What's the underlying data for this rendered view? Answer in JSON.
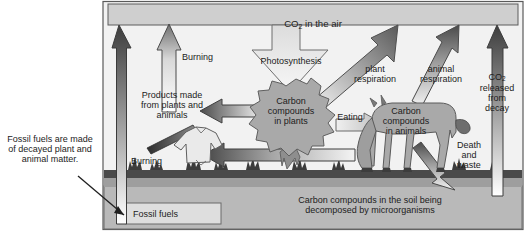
{
  "diagram": {
    "type": "carbon-cycle-flow-diagram",
    "palette": {
      "frame_border": "#5a5a5a",
      "sky_panel": "#cfcfcf",
      "ground_soil": "#b5b5b5",
      "ground_dark_band": "#4a4a4a",
      "arrow_dark": "#4d4d4d",
      "arrow_mid": "#9a9a9a",
      "arrow_light": "#e8e8e8",
      "organism_fill": "#a9a9a9",
      "text": "#1c1c1c",
      "page_bg": "#ffffff"
    }
  },
  "reservoirs": {
    "atmosphere": {
      "label_pre": "CO",
      "label_sub": "2",
      "label_post": " in the air"
    },
    "plants": {
      "label": "Carbon\ncompounds\nin plants"
    },
    "animals": {
      "label": "Carbon\ncompounds\nin animals"
    },
    "soil": {
      "label": "Carbon compounds in the soil being\ndecomposed by microorganisms"
    },
    "fossil_fuels": {
      "label": "Fossil fuels"
    }
  },
  "flows": {
    "photosynthesis": {
      "label": "Photosynthesis"
    },
    "plant_respiration": {
      "label": "plant\nrespiration"
    },
    "animal_respiration": {
      "label": "animal\nrespiration"
    },
    "eating": {
      "label": "Eating"
    },
    "death_and_waste": {
      "label": "Death\nand\nwaste"
    },
    "co2_from_decay": {
      "label_pre": "CO",
      "label_sub": "2",
      "label_post": "\nreleased\nfrom\ndecay"
    },
    "burning_fossil_fuels": {
      "label": "Burning"
    },
    "burning_products": {
      "label": "Burning"
    },
    "products": {
      "label": "Products made\nfrom plants and\nanimals"
    }
  },
  "annotations": {
    "fossil_fuel_note": {
      "label": "Fossil fuels are made\nof decayed plant and\nanimal matter."
    }
  }
}
